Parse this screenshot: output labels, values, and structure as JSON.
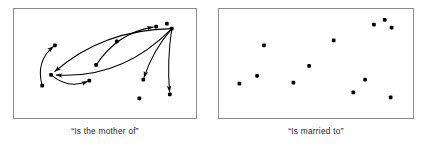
{
  "figure": {
    "background_color": "#ffffff",
    "node_color": "#000000",
    "edge_color": "#000000",
    "border_color": "#8c8c8c"
  },
  "panels": [
    {
      "id": "panel-left",
      "caption": "“Is the mother of”",
      "width": 184,
      "height": 111,
      "nodes": [
        {
          "label": "n1",
          "x": 28,
          "y": 78
        },
        {
          "label": "n2",
          "x": 41,
          "y": 37
        },
        {
          "label": "n3",
          "x": 37,
          "y": 67
        },
        {
          "label": "n4",
          "x": 76,
          "y": 73
        },
        {
          "label": "n5",
          "x": 83,
          "y": 57
        },
        {
          "label": "n6",
          "x": 104,
          "y": 33
        },
        {
          "label": "n7",
          "x": 144,
          "y": 18
        },
        {
          "label": "n8",
          "x": 155,
          "y": 15
        },
        {
          "label": "n9",
          "x": 160,
          "y": 20
        },
        {
          "label": "n10",
          "x": 131,
          "y": 72
        },
        {
          "label": "n11",
          "x": 127,
          "y": 91
        },
        {
          "label": "n12",
          "x": 158,
          "y": 87
        }
      ],
      "edges": [
        {
          "from": "n1",
          "to": "n2",
          "curve": -14
        },
        {
          "from": "n9",
          "to": "n3",
          "curve": -30
        },
        {
          "from": "n9",
          "to": "n3",
          "curve": 24
        },
        {
          "from": "n3",
          "to": "n4",
          "curve": 12
        },
        {
          "from": "n5",
          "to": "n7",
          "curve": -16
        },
        {
          "from": "n9",
          "to": "n10",
          "curve": 6
        },
        {
          "from": "n9",
          "to": "n12",
          "curve": 4
        }
      ]
    },
    {
      "id": "panel-right",
      "caption": "“Is married to”",
      "width": 196,
      "height": 111,
      "nodes": [
        {
          "label": "m1",
          "x": 20,
          "y": 76
        },
        {
          "label": "m2",
          "x": 38,
          "y": 68
        },
        {
          "label": "m3",
          "x": 45,
          "y": 37
        },
        {
          "label": "m4",
          "x": 75,
          "y": 75
        },
        {
          "label": "m5",
          "x": 91,
          "y": 58
        },
        {
          "label": "m6",
          "x": 116,
          "y": 32
        },
        {
          "label": "m7",
          "x": 136,
          "y": 85
        },
        {
          "label": "m8",
          "x": 148,
          "y": 72
        },
        {
          "label": "m9",
          "x": 157,
          "y": 16
        },
        {
          "label": "m10",
          "x": 168,
          "y": 11
        },
        {
          "label": "m11",
          "x": 175,
          "y": 19
        },
        {
          "label": "m12",
          "x": 174,
          "y": 90
        }
      ],
      "edges": []
    }
  ]
}
